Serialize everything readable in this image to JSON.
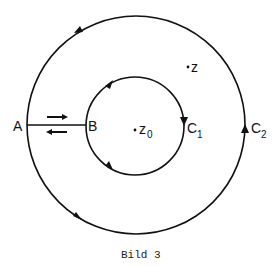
{
  "figure": {
    "caption": "Bild 3",
    "colors": {
      "stroke": "#111111",
      "background": "#ffffff"
    },
    "labels": {
      "A": "A",
      "B": "B",
      "z": "z",
      "z0_main": "z",
      "z0_sub": "0",
      "C1_main": "C",
      "C1_sub": "1",
      "C2_main": "C",
      "C2_sub": "2"
    },
    "curves": [
      {
        "name": "C2",
        "type": "circle",
        "role": "outer contour",
        "orientation": "counterclockwise"
      },
      {
        "name": "C1",
        "type": "circle",
        "role": "inner contour",
        "orientation": "clockwise"
      },
      {
        "name": "AB",
        "type": "segment",
        "role": "cut between contours",
        "traversal": "both directions"
      }
    ],
    "points": [
      {
        "name": "z",
        "position": "between C1 and C2"
      },
      {
        "name": "z0",
        "position": "center, inside C1"
      }
    ]
  }
}
